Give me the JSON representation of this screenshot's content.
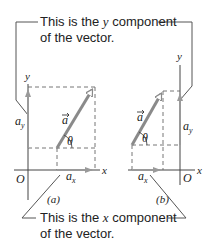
{
  "callouts": {
    "top": {
      "line1_pre": "This is the ",
      "line1_var": "y",
      "line1_post": " component",
      "line2": "of the vector."
    },
    "bottom": {
      "line1_pre": "This is the ",
      "line1_var": "x",
      "line1_post": " component",
      "line2": "of the vector."
    }
  },
  "panels": [
    {
      "label": "(a)",
      "x_axis": "x",
      "y_axis": "y",
      "origin": "O",
      "vector": "a",
      "angle": "θ",
      "x_component": "a_x",
      "y_component": "a_y"
    },
    {
      "label": "(b)",
      "x_axis": "x",
      "y_axis": "y",
      "origin": "O",
      "vector": "a",
      "angle": "θ",
      "x_component": "a_x",
      "y_component": "a_y"
    }
  ],
  "colors": {
    "vector": "#8a8a8a",
    "component": "#9a9a9a",
    "axis": "#444444",
    "dashed": "#666666",
    "callout_line": "#555555",
    "text": "#222222"
  }
}
